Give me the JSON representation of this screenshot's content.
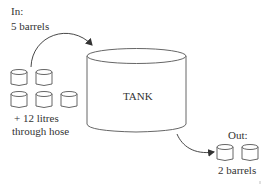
{
  "diagram": {
    "input": {
      "heading": "In:",
      "barrels_label": "5 barrels",
      "barrel_count": 5,
      "hose_line1": "+ 12 litres",
      "hose_line2": "through hose"
    },
    "tank": {
      "label": "TANK"
    },
    "output": {
      "heading": "Out:",
      "barrels_label": "2 barrels",
      "barrel_count": 2
    },
    "colors": {
      "stroke": "#555555",
      "text": "#333333",
      "background": "#ffffff"
    }
  }
}
